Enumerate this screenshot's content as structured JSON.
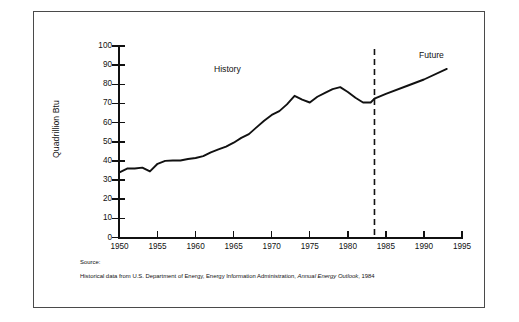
{
  "figure": {
    "y_axis_title": "Quadrillion Btu",
    "history_label": "History",
    "future_label": "Future",
    "source_heading": "Source:",
    "source_prefix": "Historical data from U.S. Department of Energy, Energy Information Administration, ",
    "source_italic": "Annual Energy Outlook",
    "source_suffix": ", 1984"
  },
  "chart_data": {
    "type": "line",
    "title": "",
    "xlabel": "",
    "ylabel": "Quadrillion Btu",
    "xlim": [
      1950,
      1995
    ],
    "ylim": [
      0,
      100
    ],
    "grid": false,
    "legend": "none",
    "xticks": [
      1950,
      1955,
      1960,
      1965,
      1970,
      1975,
      1980,
      1985,
      1990,
      1995
    ],
    "yticks": [
      0,
      10,
      20,
      30,
      40,
      50,
      60,
      70,
      80,
      90,
      100
    ],
    "annotations": [
      {
        "text": "History",
        "x": 1965,
        "y": 95
      },
      {
        "text": "Future",
        "x": 1991,
        "y": 99
      }
    ],
    "divider": {
      "x": 1983.5,
      "style": "dashed",
      "label": "history-future split"
    },
    "series": [
      {
        "name": "Total U.S. energy consumption",
        "segment": "history",
        "x": [
          1950,
          1951,
          1952,
          1953,
          1954,
          1955,
          1956,
          1957,
          1958,
          1959,
          1960,
          1961,
          1962,
          1963,
          1964,
          1965,
          1966,
          1967,
          1968,
          1969,
          1970,
          1971,
          1972,
          1973,
          1974,
          1975,
          1976,
          1977,
          1978,
          1979,
          1980,
          1981,
          1982,
          1983,
          1983.5
        ],
        "values": [
          34.0,
          36.0,
          36.0,
          36.5,
          34.5,
          38.5,
          40.0,
          40.2,
          40.2,
          41.0,
          41.5,
          42.5,
          44.5,
          46.0,
          47.5,
          49.5,
          52.0,
          54.0,
          57.5,
          61.0,
          64.0,
          66.0,
          69.5,
          74.0,
          72.0,
          70.5,
          73.5,
          75.5,
          77.5,
          78.5,
          76.0,
          73.0,
          70.5,
          70.5,
          72.5
        ]
      },
      {
        "name": "Total U.S. energy consumption",
        "segment": "future",
        "x": [
          1983.5,
          1985,
          1988,
          1990,
          1993
        ],
        "values": [
          72.5,
          75.0,
          79.5,
          82.5,
          88.0
        ]
      }
    ]
  }
}
